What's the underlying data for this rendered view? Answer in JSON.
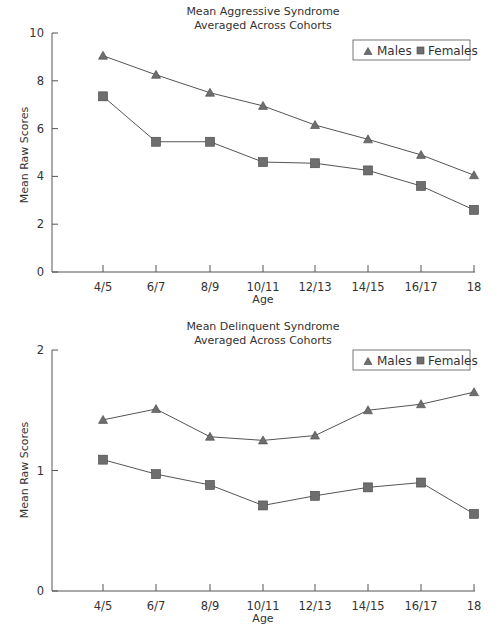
{
  "chart_data": [
    {
      "type": "line",
      "title": "Mean Aggressive Syndrome",
      "subtitle": "Averaged Across Cohorts",
      "xlabel": "Age",
      "ylabel": "Mean Raw Scores",
      "categories": [
        "4/5",
        "6/7",
        "8/9",
        "10/11",
        "12/13",
        "14/15",
        "16/17",
        "18"
      ],
      "ylim": [
        0,
        10
      ],
      "yticks": [
        "0",
        "2",
        "4",
        "6",
        "8",
        "10"
      ],
      "grid": false,
      "legend_position": "top-right",
      "series": [
        {
          "name": "Males",
          "marker": "triangle",
          "values": [
            9.05,
            8.25,
            7.5,
            6.95,
            6.15,
            5.55,
            4.9,
            4.05
          ]
        },
        {
          "name": "Females",
          "marker": "square",
          "values": [
            7.35,
            5.45,
            5.45,
            4.6,
            4.55,
            4.25,
            3.6,
            2.6
          ]
        }
      ]
    },
    {
      "type": "line",
      "title": "Mean Delinquent Syndrome",
      "subtitle": "Averaged Across Cohorts",
      "xlabel": "Age",
      "ylabel": "Mean Raw Scores",
      "categories": [
        "4/5",
        "6/7",
        "8/9",
        "10/11",
        "12/13",
        "14/15",
        "16/17",
        "18"
      ],
      "ylim": [
        0,
        2
      ],
      "yticks": [
        "0",
        "1",
        "2"
      ],
      "grid": false,
      "legend_position": "top-right",
      "series": [
        {
          "name": "Males",
          "marker": "triangle",
          "values": [
            1.42,
            1.51,
            1.28,
            1.25,
            1.29,
            1.5,
            1.55,
            1.65
          ]
        },
        {
          "name": "Females",
          "marker": "square",
          "values": [
            1.09,
            0.97,
            0.88,
            0.71,
            0.79,
            0.86,
            0.9,
            0.64
          ]
        }
      ]
    }
  ],
  "charts": [
    {
      "title_line1": "Mean Aggressive Syndrome",
      "title_line2": "Averaged Across Cohorts",
      "xlabel": "Age",
      "ylabel": "Mean Raw Scores",
      "legend": {
        "males": "Males",
        "females": "Females"
      }
    },
    {
      "title_line1": "Mean Delinquent Syndrome",
      "title_line2": "Averaged Across Cohorts",
      "xlabel": "Age",
      "ylabel": "Mean Raw Scores",
      "legend": {
        "males": "Males",
        "females": "Females"
      }
    }
  ],
  "colors": {
    "line": "#555555",
    "marker_fill": "#6e6e6e",
    "axis": "#555555",
    "text": "#333333"
  }
}
